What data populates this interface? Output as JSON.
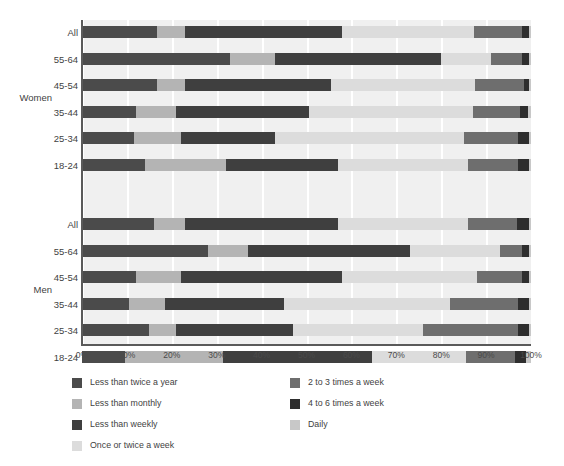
{
  "chart_data": {
    "type": "bar",
    "title": "",
    "subtitle": "",
    "xlabel": "",
    "ylabel": "",
    "orientation": "horizontal",
    "stacked": true,
    "stack_mode": "percent",
    "xlim": [
      0,
      100
    ],
    "grid": true,
    "grid_axis": "x",
    "legend_position": "bottom-left",
    "axis_tick_labels": [
      "0%",
      "10%",
      "20%",
      "30%",
      "40%",
      "50%",
      "60%",
      "70%",
      "80%",
      "90%",
      "100%"
    ],
    "axis_tick_values": [
      0,
      10,
      20,
      30,
      40,
      50,
      60,
      70,
      80,
      90,
      100
    ],
    "group_labels": [
      "Women",
      "Men"
    ],
    "categories": [
      "All",
      "55-64",
      "45-54",
      "35-44",
      "25-34",
      "18-24",
      "All",
      "55-64",
      "45-54",
      "35-44",
      "25-34",
      "18-24"
    ],
    "series": [
      {
        "name": "Less than twice a year",
        "color": "#4b4b4b",
        "values": [
          16.7,
          33.0,
          16.7,
          12.0,
          11.5,
          14.0,
          16.0,
          28.0,
          12.0,
          10.5,
          15.0,
          9.5
        ]
      },
      {
        "name": "Less than monthly",
        "color": "#b4b4b4",
        "values": [
          6.3,
          10.0,
          6.3,
          9.0,
          10.5,
          18.0,
          7.0,
          9.0,
          10.0,
          8.0,
          6.0,
          22.0
        ]
      },
      {
        "name": "Less than weekly",
        "color": "#3f3f3f",
        "values": [
          34.8,
          37.0,
          32.5,
          29.5,
          21.0,
          25.0,
          34.0,
          36.0,
          36.0,
          26.5,
          26.0,
          33.0
        ]
      },
      {
        "name": "Once or twice a week",
        "color": "#dcdcdc",
        "values": [
          29.6,
          11.0,
          32.0,
          36.5,
          42.0,
          29.0,
          29.0,
          20.0,
          30.0,
          37.0,
          29.0,
          21.0
        ]
      },
      {
        "name": "2 to 3 times a week",
        "color": "#6e6e6e",
        "values": [
          10.5,
          7.0,
          11.0,
          10.5,
          12.0,
          11.0,
          11.0,
          5.0,
          10.0,
          15.0,
          21.0,
          11.0
        ]
      },
      {
        "name": "4 to 6 times a week",
        "color": "#2e2e2e",
        "values": [
          1.6,
          1.5,
          1.0,
          1.8,
          2.5,
          2.5,
          2.5,
          1.5,
          1.5,
          2.5,
          2.5,
          2.5
        ]
      },
      {
        "name": "Daily",
        "color": "#c8c8c8",
        "values": [
          0.5,
          0.5,
          0.5,
          0.7,
          0.5,
          0.5,
          0.5,
          0.5,
          0.5,
          0.5,
          0.5,
          1.0
        ]
      }
    ]
  },
  "legend": {
    "column_1": [
      {
        "label": "Less than twice a year",
        "color": "#4b4b4b",
        "icon": "legend-swatch"
      },
      {
        "label": "Less than monthly",
        "color": "#b4b4b4",
        "icon": "legend-swatch"
      },
      {
        "label": "Less than weekly",
        "color": "#3f3f3f",
        "icon": "legend-swatch"
      },
      {
        "label": "Once or twice a week",
        "color": "#dcdcdc",
        "icon": "legend-swatch"
      }
    ],
    "column_2": [
      {
        "label": "2 to 3 times a week",
        "color": "#6e6e6e",
        "icon": "legend-swatch"
      },
      {
        "label": "4 to 6 times a week",
        "color": "#2e2e2e",
        "icon": "legend-swatch"
      },
      {
        "label": "Daily",
        "color": "#c8c8c8",
        "icon": "legend-swatch"
      }
    ]
  },
  "style": {
    "plot_background": "#f0f0f0",
    "gridline_color": "#ffffff",
    "axis_color": "#5a5a5a",
    "text_color": "#3f3f3f",
    "page_background": "#ffffff"
  }
}
